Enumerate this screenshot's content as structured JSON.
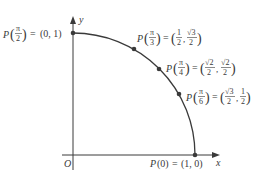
{
  "diagram": {
    "type": "unit-circle-quadrant",
    "axes": {
      "x_label": "x",
      "y_label": "y",
      "origin_label": "O"
    },
    "points": [
      {
        "id": "p0",
        "angle": "0",
        "label": "P(0) = (1, 0)",
        "coords": "(1, 0)"
      },
      {
        "id": "p-pi-6",
        "angle": "π/6",
        "label": "P(π/6) = (√3/2, 1/2)",
        "coords": "(√3/2, 1/2)"
      },
      {
        "id": "p-pi-4",
        "angle": "π/4",
        "label": "P(π/4) = (√2/2, √2/2)",
        "coords": "(√2/2, √2/2)"
      },
      {
        "id": "p-pi-3",
        "angle": "π/3",
        "label": "P(π/3) = (1/2, √3/2)",
        "coords": "(1/2, √3/2)"
      },
      {
        "id": "p-pi-2",
        "angle": "π/2",
        "label": "P(π/2) = (0, 1)",
        "coords": "(0, 1)"
      }
    ],
    "text": {
      "P": "P",
      "eq": "=",
      "pi": "π",
      "two": "2",
      "three": "3",
      "four": "4",
      "six": "6",
      "one": "1",
      "sqrt2": "√2",
      "sqrt3": "√3",
      "zero_arg": "(0)",
      "p0_coords": "(1, 0)",
      "p_pi2_coords": "(0, 1)",
      "lp": "(",
      "rp": ")",
      "comma": ","
    },
    "colors": {
      "curve": "#3a3a3a",
      "axis": "#3a3a3a",
      "text": "#3a3a3a"
    }
  }
}
